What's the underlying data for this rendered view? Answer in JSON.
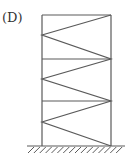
{
  "diagram": {
    "label": "(D)",
    "type": "braced-frame",
    "stroke_color": "#5a5a5a",
    "columns": {
      "left_x": 42,
      "right_x": 111
    },
    "beams_y": [
      15,
      59,
      101
    ],
    "ground": {
      "y": 146,
      "x_start": 27,
      "x_end": 125,
      "hatch_count": 16
    },
    "bracing_points": [
      [
        111,
        15
      ],
      [
        42,
        35
      ],
      [
        111,
        59
      ],
      [
        42,
        79
      ],
      [
        111,
        101
      ],
      [
        42,
        122
      ],
      [
        111,
        146
      ]
    ]
  }
}
